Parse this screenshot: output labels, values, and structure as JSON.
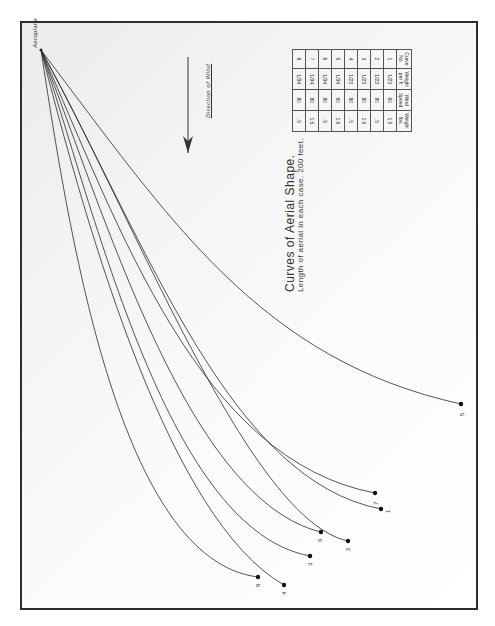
{
  "title": "Curves of Aerial Shape.",
  "subtitle": "Length of aerial in each case. 200 feet.",
  "wind_label": "Direction of Wind",
  "origin_label": "Aeroplane",
  "table": {
    "headers": [
      "Curve No.",
      "Weight per ft.",
      "Wind Speed",
      "Weight lbs."
    ],
    "rows": [
      [
        "1",
        "1/23",
        "60",
        "1.5"
      ],
      [
        "2",
        "1/23",
        "80",
        ".5"
      ],
      [
        "3",
        "1/23",
        "80",
        "1.5"
      ],
      [
        "4",
        "1/23",
        "80",
        ".5"
      ],
      [
        "5",
        "1/34",
        "60",
        "1.5"
      ],
      [
        "6",
        "1/34",
        "80",
        ".5"
      ],
      [
        "7",
        "1/34",
        "80",
        "1.5"
      ],
      [
        "8",
        "1/34",
        "80",
        ".5"
      ]
    ]
  },
  "curves": [
    {
      "id": "1",
      "label": "1",
      "end": [
        381,
        509
      ]
    },
    {
      "id": "2",
      "label": "2",
      "end": [
        348,
        541
      ]
    },
    {
      "id": "3",
      "label": "3",
      "end": [
        310,
        556
      ]
    },
    {
      "id": "4",
      "label": "4",
      "end": [
        284,
        585
      ]
    },
    {
      "id": "5",
      "label": "5",
      "end": [
        461,
        404
      ]
    },
    {
      "id": "6",
      "label": "6",
      "end": [
        321,
        532
      ]
    },
    {
      "id": "7",
      "label": "7",
      "end": [
        375,
        493
      ]
    },
    {
      "id": "8",
      "label": "8",
      "end": [
        258,
        577
      ]
    }
  ],
  "colors": {
    "line": "#2a2a2a",
    "frame": "#2e2e2e"
  }
}
